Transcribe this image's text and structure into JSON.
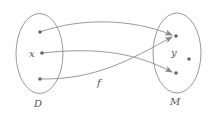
{
  "diagram": {
    "type": "function-mapping",
    "colors": {
      "stroke": "#9a9a9a",
      "point": "#666666",
      "text": "#555555"
    },
    "sets": [
      {
        "name": "domain",
        "label": "D",
        "cx": 39.5,
        "cy": 53.5,
        "rx": 23.5,
        "ry": 40,
        "label_pos": [
          38,
          107
        ],
        "points": [
          {
            "id": "d1",
            "x": 40,
            "y": 32
          },
          {
            "id": "x",
            "x": 42,
            "y": 53,
            "label": "x",
            "label_pos": [
              29,
              57
            ]
          },
          {
            "id": "d3",
            "x": 40,
            "y": 79
          }
        ]
      },
      {
        "name": "codomain",
        "label": "M",
        "cx": 177,
        "cy": 53,
        "rx": 24,
        "ry": 40,
        "label_pos": [
          175,
          105
        ],
        "points": [
          {
            "id": "m1",
            "x": 176,
            "y": 36
          },
          {
            "id": "m2",
            "x": 176,
            "y": 73
          },
          {
            "id": "m3",
            "x": 189,
            "y": 59
          }
        ],
        "inner_label": {
          "text": "y",
          "pos": [
            171,
            56
          ]
        }
      }
    ],
    "mapping_label": {
      "text": "f",
      "pos": [
        97,
        86
      ]
    },
    "arrows": [
      {
        "from": "d1",
        "to": "m1",
        "path": "M40,32 C80,18 130,18 172,35"
      },
      {
        "from": "x",
        "to": "m2",
        "path": "M42,53 C90,48 130,50 172,72"
      },
      {
        "from": "d3",
        "to": "m1",
        "path": "M40,79 C95,80 130,60 172,37"
      }
    ]
  }
}
